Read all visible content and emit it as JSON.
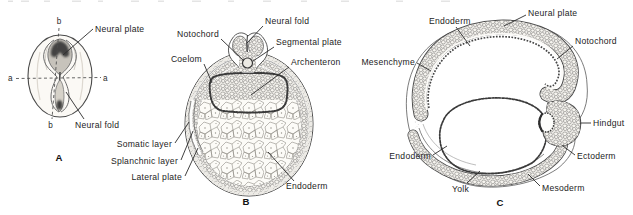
{
  "figure_type": "embryology textbook line illustration, three panels",
  "colors": {
    "ink": "#2b2b2b",
    "paper": "#ffffff",
    "shading_gray": "#8a8a8a",
    "band_base": "#f0eeea"
  },
  "panelA": {
    "letter": "A",
    "axes": {
      "b_top": "b",
      "b_bottom": "b",
      "a_left": "a",
      "a_right": "a"
    },
    "labels": {
      "neural_plate": "Neural plate",
      "neural_fold": "Neural fold"
    }
  },
  "panelB": {
    "letter": "B",
    "labels": {
      "neural_fold": "Neural fold",
      "notochord": "Notochord",
      "coelom": "Coelom",
      "segmental_plate": "Segmental plate",
      "archenteron": "Archenteron",
      "somatic_layer": "Somatic layer",
      "splanchnic_layer": "Splanchnic layer",
      "lateral_plate": "Lateral plate",
      "endoderm": "Endoderm"
    }
  },
  "panelC": {
    "letter": "C",
    "labels": {
      "endoderm_top": "Endoderm",
      "neural_plate": "Neural plate",
      "notochord": "Notochord",
      "mesenchyme": "Mesenchyme",
      "hindgut": "Hindgut",
      "endoderm_bottom": "Endoderm",
      "yolk": "Yolk",
      "ectoderm": "Ectoderm",
      "mesoderm": "Mesoderm"
    }
  }
}
